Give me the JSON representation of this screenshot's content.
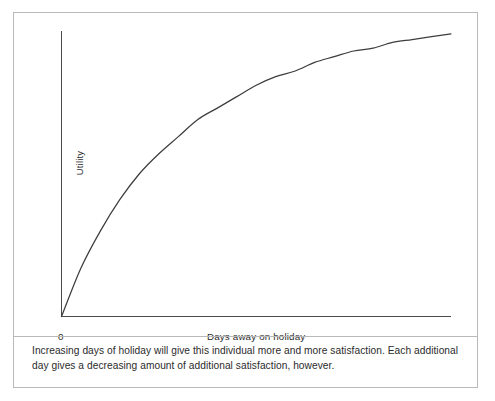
{
  "figure": {
    "caption": "Increasing days of holiday will give this individual more and more satisfaction. Each additional day gives a decreasing amount of additional satisfaction, however.",
    "border_color": "#b9b9b9",
    "background_color": "#ffffff"
  },
  "axes": {
    "y_label": "Utility",
    "x_label": "Days away on holiday",
    "origin_label": "0",
    "axis_color": "#4a4a4a"
  },
  "chart_data": {
    "type": "line",
    "title": "",
    "subtitle": "",
    "xlabel": "Days away on holiday",
    "ylabel": "Utility",
    "xlim": [
      0,
      100
    ],
    "ylim": [
      0,
      100
    ],
    "grid": false,
    "legend": null,
    "curve_color": "#3d3d3d",
    "annotation": "Increasing days of holiday will give this individual more and more satisfaction. Each additional day gives a decreasing amount of additional satisfaction, however.",
    "x": [
      0,
      5,
      10,
      15,
      20,
      25,
      30,
      35,
      40,
      45,
      50,
      55,
      60,
      65,
      70,
      75,
      80,
      85,
      90,
      95,
      100
    ],
    "y": [
      0,
      17,
      30,
      41,
      50,
      57,
      63,
      69,
      73,
      77,
      81,
      84,
      86,
      89,
      91,
      93,
      94,
      96,
      97,
      98,
      99
    ],
    "series": [
      {
        "name": "Utility",
        "x": [
          0,
          5,
          10,
          15,
          20,
          25,
          30,
          35,
          40,
          45,
          50,
          55,
          60,
          65,
          70,
          75,
          80,
          85,
          90,
          95,
          100
        ],
        "values": [
          0,
          17,
          30,
          41,
          50,
          57,
          63,
          69,
          73,
          77,
          81,
          84,
          86,
          89,
          91,
          93,
          94,
          96,
          97,
          98,
          99
        ]
      }
    ]
  }
}
